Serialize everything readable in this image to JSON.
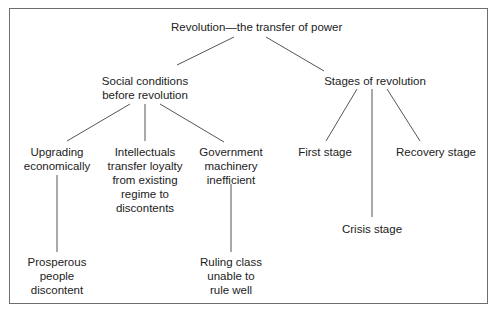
{
  "diagram": {
    "type": "tree",
    "root": {
      "label": "Revolution—the transfer of power",
      "children": [
        {
          "label_lines": [
            "Social conditions",
            "before revolution"
          ],
          "children": [
            {
              "label_lines": [
                "Upgrading",
                "economically"
              ],
              "children": [
                {
                  "label_lines": [
                    "Prosperous",
                    "people",
                    "discontent"
                  ]
                }
              ]
            },
            {
              "label_lines": [
                "Intellectuals",
                "transfer loyalty",
                "from existing",
                "regime to",
                "discontents"
              ]
            },
            {
              "label_lines": [
                "Government",
                "machinery",
                "inefficient"
              ],
              "children": [
                {
                  "label_lines": [
                    "Ruling class",
                    "unable to",
                    "rule well"
                  ]
                }
              ]
            }
          ]
        },
        {
          "label_lines": [
            "Stages of revolution"
          ],
          "children": [
            {
              "label_lines": [
                "First stage"
              ]
            },
            {
              "label_lines": [
                "Crisis stage"
              ]
            },
            {
              "label_lines": [
                "Recovery stage"
              ]
            }
          ]
        }
      ]
    },
    "colors": {
      "text": "#222222",
      "line": "#555555",
      "frame": "#6e6e6e",
      "background": "#ffffff"
    }
  }
}
